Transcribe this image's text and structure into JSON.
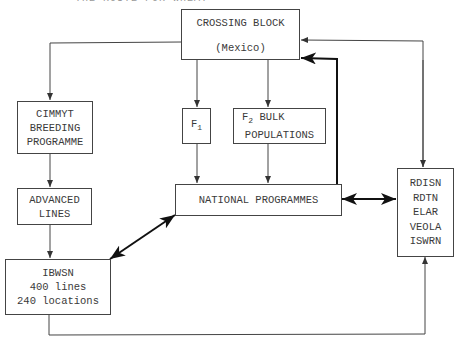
{
  "diagram": {
    "caption_partial": "THE ROUTE FOR WHEAT",
    "nodes": {
      "crossing_block": {
        "title": "CROSSING BLOCK",
        "subtitle": "(Mexico)"
      },
      "cimmyt": {
        "lines": [
          "CIMMYT",
          "BREEDING",
          "PROGRAMME"
        ]
      },
      "advanced_lines": {
        "lines": [
          "ADVANCED",
          "LINES"
        ]
      },
      "ibwsn": {
        "lines": [
          "IBWSN",
          "400 lines",
          "240 locations"
        ]
      },
      "f1": {
        "label": "F",
        "sub": "1"
      },
      "f2": {
        "label": "F",
        "sub": "2",
        "rest": " BULK",
        "line2": "POPULATIONS"
      },
      "national_programmes": {
        "label": "NATIONAL PROGRAMMES"
      },
      "nurseries": {
        "lines": [
          "RDISN",
          "RDTN",
          "ELAR",
          "VEOLA",
          "ISWRN"
        ]
      }
    },
    "edges": [
      {
        "from": "crossing_block",
        "to": "cimmyt",
        "style": "thin"
      },
      {
        "from": "cimmyt",
        "to": "advanced_lines",
        "style": "thin"
      },
      {
        "from": "advanced_lines",
        "to": "ibwsn",
        "style": "thin"
      },
      {
        "from": "crossing_block",
        "to": "f1",
        "style": "thin"
      },
      {
        "from": "crossing_block",
        "to": "f2",
        "style": "thin"
      },
      {
        "from": "f1",
        "to": "national_programmes",
        "style": "thin"
      },
      {
        "from": "f2",
        "to": "national_programmes",
        "style": "thin"
      },
      {
        "from": "national_programmes",
        "to": "crossing_block",
        "style": "thick"
      },
      {
        "from": "ibwsn",
        "to": "national_programmes",
        "style": "thick-bidirectional"
      },
      {
        "from": "national_programmes",
        "to": "nurseries",
        "style": "thick-bidirectional"
      },
      {
        "from": "nurseries",
        "to": "crossing_block",
        "style": "thin-bidirectional"
      },
      {
        "from": "ibwsn",
        "to": "nurseries",
        "style": "thin"
      }
    ]
  }
}
